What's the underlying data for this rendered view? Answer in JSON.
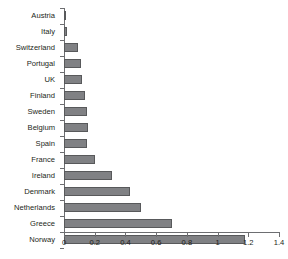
{
  "chart_data": {
    "type": "bar",
    "orientation": "horizontal",
    "title": "",
    "subtitle": "",
    "xlabel": "",
    "ylabel": "",
    "xlim": [
      0,
      1.4
    ],
    "xticks": [
      "0",
      "0.2",
      "0.4",
      "0.6",
      "0.8",
      "1",
      "1.2",
      "1.4"
    ],
    "xtick_values": [
      0,
      0.2,
      0.4,
      0.6,
      0.8,
      1.0,
      1.2,
      1.4
    ],
    "grid": false,
    "legend": false,
    "categories": [
      "Austria",
      "Italy",
      "Switzerland",
      "Portugal",
      "UK",
      "Finland",
      "Sweden",
      "Belgium",
      "Spain",
      "France",
      "Ireland",
      "Denmark",
      "Netherlands",
      "Greece",
      "Norway"
    ],
    "values": [
      0.01,
      0.02,
      0.09,
      0.11,
      0.115,
      0.135,
      0.15,
      0.155,
      0.15,
      0.2,
      0.31,
      0.43,
      0.5,
      0.7,
      1.18
    ],
    "bar_color": "#808184",
    "bar_border_color": "#58595b",
    "axis_color": "#6d6e71",
    "background_color": "#ffffff",
    "text_color": "#231f20"
  }
}
